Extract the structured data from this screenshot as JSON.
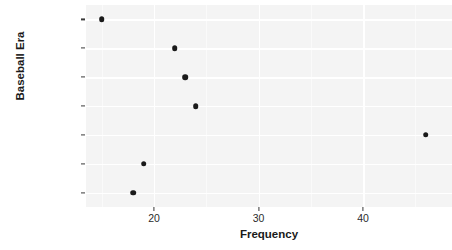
{
  "chart_data": {
    "type": "scatter",
    "title": "",
    "xlabel": "Frequency",
    "ylabel": "Baseball Era",
    "categories": [
      "Long Ball",
      "Free Agency",
      "Expansion",
      "Integration",
      "Lively Ball",
      "Dead Ball",
      "19th Century"
    ],
    "values": [
      15,
      22,
      23,
      24,
      46,
      19,
      18
    ],
    "xticks": [
      20,
      30,
      40
    ],
    "xtick_labels": [
      "20",
      "30",
      "40"
    ],
    "xlim": [
      13.5,
      48.5
    ],
    "grid": true,
    "legend": "none",
    "point_color": "#1a1a1a",
    "panel_color": "#f4f4f4",
    "gridline_color": "#ffffff"
  },
  "axes": {
    "y_title": "Baseball Era",
    "x_title": "Frequency"
  },
  "points": [
    {
      "label": "Long Ball",
      "value": 15
    },
    {
      "label": "Free Agency",
      "value": 22
    },
    {
      "label": "Expansion",
      "value": 23
    },
    {
      "label": "Integration",
      "value": 24
    },
    {
      "label": "Lively Ball",
      "value": 46
    },
    {
      "label": "Dead Ball",
      "value": 19
    },
    {
      "label": "19th Century",
      "value": 18
    }
  ]
}
